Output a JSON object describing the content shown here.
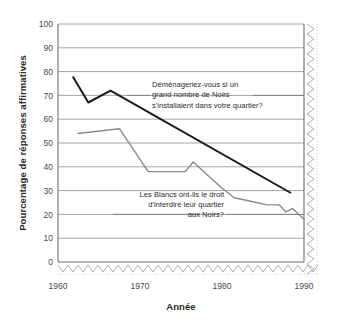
{
  "chart_data": {
    "type": "line",
    "title": "",
    "xlabel": "Année",
    "ylabel": "Pourcentage de réponses affirmatives",
    "xlim": [
      1960,
      1990
    ],
    "ylim": [
      0,
      100
    ],
    "xticks": [
      "1960",
      "1970",
      "1980",
      "1990"
    ],
    "yticks": [
      "0",
      "10",
      "20",
      "30",
      "40",
      "50",
      "60",
      "70",
      "80",
      "90",
      "100"
    ],
    "grid": "horizontal",
    "legend_position": "inline-annotations",
    "series": [
      {
        "name": "Déménageriez-vous si un grand nombre de Noirs s'installaient dans votre quartier?",
        "color": "#1a1a1a",
        "points": [
          {
            "x": 1961.8,
            "y": 78
          },
          {
            "x": 1963.7,
            "y": 67
          },
          {
            "x": 1966.4,
            "y": 72
          },
          {
            "x": 1988.4,
            "y": 29
          }
        ]
      },
      {
        "name": "Les Blancs ont-ils le droit d'interdire leur quartier aux Noirs?",
        "color": "#8a8a8a",
        "points": [
          {
            "x": 1962.4,
            "y": 54
          },
          {
            "x": 1967.5,
            "y": 56
          },
          {
            "x": 1971.0,
            "y": 38
          },
          {
            "x": 1975.5,
            "y": 38
          },
          {
            "x": 1976.5,
            "y": 42
          },
          {
            "x": 1980.0,
            "y": 31
          },
          {
            "x": 1981.5,
            "y": 27
          },
          {
            "x": 1983.5,
            "y": 25.5
          },
          {
            "x": 1985.5,
            "y": 24
          },
          {
            "x": 1987.0,
            "y": 24
          },
          {
            "x": 1987.8,
            "y": 21
          },
          {
            "x": 1988.6,
            "y": 22.5
          },
          {
            "x": 1990.0,
            "y": 18
          }
        ]
      }
    ],
    "annotations": [
      {
        "id": "annotation-move-away",
        "lines": [
          "Déménageriez-vous si un",
          "grand nombre de Noirs",
          "s'installaient dans votre quartier?"
        ]
      },
      {
        "id": "annotation-right-to-bar",
        "lines": [
          "Les Blancs ont-ils le droit",
          "d'interdire leur quartier",
          "aux Noirs?"
        ]
      }
    ]
  },
  "axes": {
    "y_title": "Pourcentage de réponses affirmatives",
    "x_title": "Année",
    "y_ticks": [
      "100",
      "90",
      "80",
      "70",
      "60",
      "50",
      "40",
      "30",
      "20",
      "10",
      "0"
    ],
    "x_ticks": [
      "1960",
      "1970",
      "1980",
      "1990"
    ]
  },
  "annotations": {
    "first": {
      "line1": "Déménageriez-vous si un",
      "line2": "grand nombre de Noirs",
      "line3": "s'installaient dans votre quartier?"
    },
    "second": {
      "line1": "Les Blancs ont-ils le droit",
      "line2": "d'interdire leur quartier",
      "line3": "aux Noirs?"
    }
  },
  "colors": {
    "series_dark": "#1a1a1a",
    "series_light": "#8a8a8a",
    "grid": "#9a9a9a",
    "frame": "#8d8d8d",
    "text": "#2b2b2b"
  }
}
